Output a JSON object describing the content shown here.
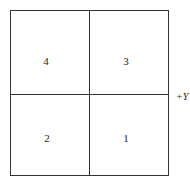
{
  "diagram": {
    "quadrants": [
      {
        "label": "4",
        "position": "top-left"
      },
      {
        "label": "3",
        "position": "top-right"
      },
      {
        "label": "2",
        "position": "bottom-left"
      },
      {
        "label": "1",
        "position": "bottom-right"
      }
    ],
    "axis_label": "+Y"
  }
}
